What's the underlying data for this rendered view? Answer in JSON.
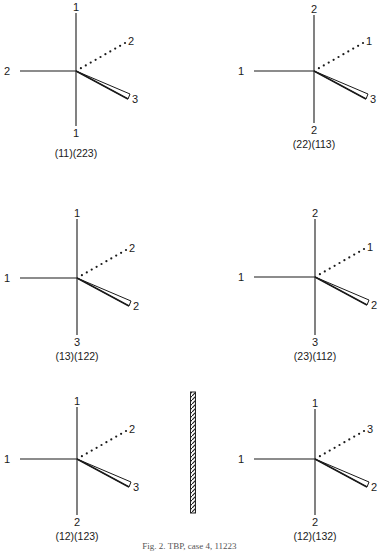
{
  "figure": {
    "caption": "Fig. 2. TBP, case 4, 11223",
    "mirror_plane": {
      "x": 193,
      "y1": 392,
      "y2": 513
    },
    "structures": [
      {
        "id": "s1",
        "center": [
          76,
          71
        ],
        "labels": {
          "top": "1",
          "left": "2",
          "dotted": "2",
          "wedge": "3",
          "bottom": "1"
        },
        "notation": "(11)(223)",
        "top_y": 8,
        "bottom_label_y": 137,
        "notation_y": 157,
        "left_x": 12
      },
      {
        "id": "s2",
        "center": [
          314,
          71
        ],
        "labels": {
          "top": "2",
          "left": "1",
          "dotted": "1",
          "wedge": "3",
          "bottom": "2"
        },
        "notation": "(22)(113)",
        "top_y": 10,
        "bottom_label_y": 134,
        "notation_y": 148,
        "left_x": 246
      },
      {
        "id": "s3",
        "center": [
          77,
          278
        ],
        "labels": {
          "top": "1",
          "left": "1",
          "dotted": "2",
          "wedge": "2",
          "bottom": "3"
        },
        "notation": "(13)(122)",
        "top_y": 214,
        "bottom_label_y": 346,
        "notation_y": 360,
        "left_x": 12
      },
      {
        "id": "s4",
        "center": [
          315,
          277
        ],
        "labels": {
          "top": "2",
          "left": "1",
          "dotted": "1",
          "wedge": "2",
          "bottom": "3"
        },
        "notation": "(23)(112)",
        "top_y": 214,
        "bottom_label_y": 346,
        "notation_y": 360,
        "left_x": 246
      },
      {
        "id": "s5",
        "center": [
          77,
          459
        ],
        "labels": {
          "top": "1",
          "left": "1",
          "dotted": "2",
          "wedge": "3",
          "bottom": "2"
        },
        "notation": "(12)(123)",
        "top_y": 402,
        "bottom_label_y": 526,
        "notation_y": 540,
        "left_x": 12
      },
      {
        "id": "s6",
        "center": [
          315,
          459
        ],
        "labels": {
          "top": "1",
          "left": "1",
          "dotted": "3",
          "wedge": "2",
          "bottom": "2"
        },
        "notation": "(12)(132)",
        "top_y": 404,
        "bottom_label_y": 526,
        "notation_y": 540,
        "left_x": 246
      }
    ]
  }
}
